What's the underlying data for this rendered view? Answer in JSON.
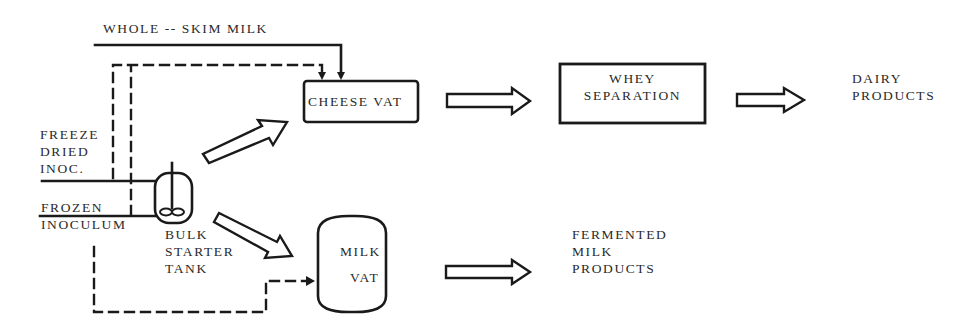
{
  "colors": {
    "background": "#ffffff",
    "line": "#1a1a1a",
    "text": "#2a2a2a"
  },
  "inputs": {
    "whole_skim_milk": "WHOLE -- SKIM MILK",
    "freeze_dried": [
      "FREEZE",
      "DRIED",
      "INOC."
    ],
    "frozen_inoculum": [
      "FROZEN",
      "INOCULUM"
    ]
  },
  "nodes": {
    "bulk_starter_tank": [
      "BULK",
      "STARTER",
      "TANK"
    ],
    "cheese_vat": "CHEESE VAT",
    "whey_separation": [
      "WHEY",
      "SEPARATION"
    ],
    "milk_vat": [
      "MILK",
      "VAT"
    ]
  },
  "outputs": {
    "dairy_products": [
      "DAIRY",
      "PRODUCTS"
    ],
    "fermented_milk_products": [
      "FERMENTED",
      "MILK",
      "PRODUCTS"
    ]
  },
  "edges": [
    {
      "from": "whole_skim_milk",
      "to": "cheese_vat",
      "style": "solid-line"
    },
    {
      "from": "freeze_dried",
      "to": "cheese_vat",
      "style": "dashed-line"
    },
    {
      "from": "frozen_inoculum",
      "to": "cheese_vat",
      "style": "dashed-line"
    },
    {
      "from": "frozen_inoculum",
      "to": "milk_vat",
      "style": "dashed-line"
    },
    {
      "from": "freeze_dried",
      "to": "bulk_starter_tank",
      "style": "solid-line"
    },
    {
      "from": "frozen_inoculum",
      "to": "bulk_starter_tank",
      "style": "solid-line"
    },
    {
      "from": "bulk_starter_tank",
      "to": "cheese_vat",
      "style": "hollow-arrow"
    },
    {
      "from": "bulk_starter_tank",
      "to": "milk_vat",
      "style": "hollow-arrow"
    },
    {
      "from": "cheese_vat",
      "to": "whey_separation",
      "style": "hollow-arrow"
    },
    {
      "from": "whey_separation",
      "to": "dairy_products",
      "style": "hollow-arrow"
    },
    {
      "from": "milk_vat",
      "to": "fermented_milk_products",
      "style": "hollow-arrow"
    }
  ]
}
